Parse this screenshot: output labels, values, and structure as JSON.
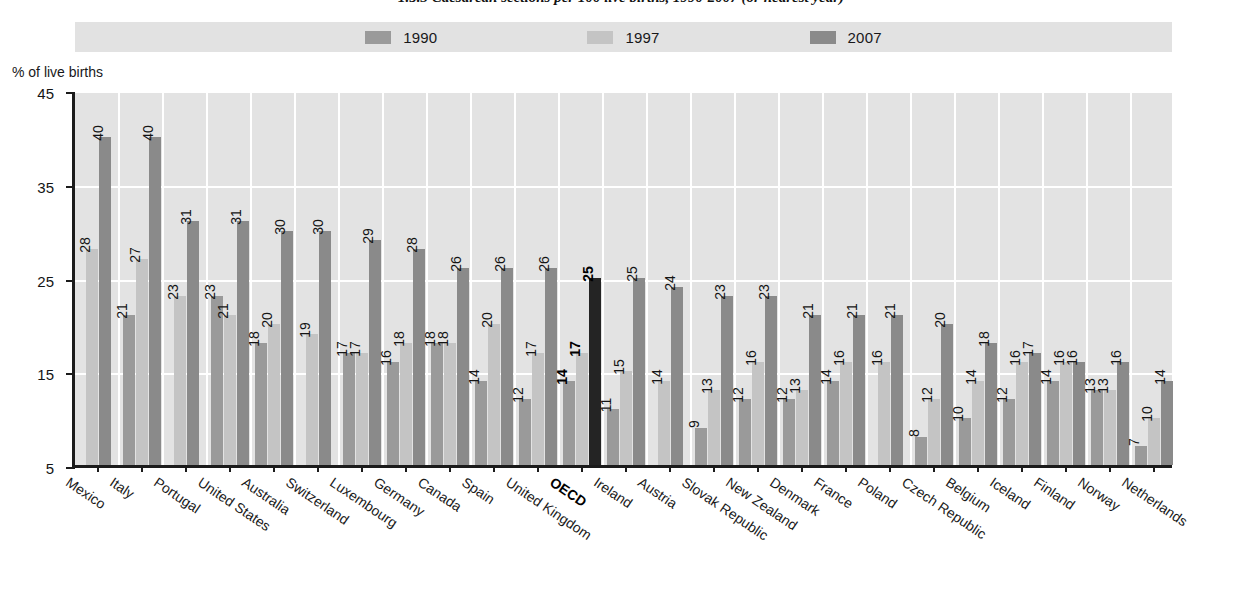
{
  "title": "1.5.3  Caesarean sections per 100 live births, 1990-2007 (or nearest year)",
  "axis_title": "% of live births",
  "legend": {
    "items": [
      {
        "label": "1990",
        "color": "#9a9a9a"
      },
      {
        "label": "1997",
        "color": "#c4c4c4"
      },
      {
        "label": "2007",
        "color": "#8a8a8a"
      }
    ]
  },
  "colors": {
    "plot_background": "#e3e3e3",
    "legend_background": "#e2e2e2",
    "gridline": "#ffffff",
    "axis": "#1b1b1b",
    "series_1990": "#9a9a9a",
    "series_1997": "#c4c4c4",
    "series_2007": "#8a8a8a",
    "highlight_2007": "#242424"
  },
  "chart_data": {
    "type": "bar",
    "title": "1.5.3  Caesarean sections per 100 live births, 1990-2007 (or nearest year)",
    "xlabel": "",
    "ylabel": "% of live births",
    "ylim": [
      5,
      45
    ],
    "yticks": [
      5,
      15,
      25,
      35,
      45
    ],
    "grid": true,
    "legend_position": "top-center",
    "categories": [
      "Mexico",
      "Italy",
      "Portugal",
      "United States",
      "Australia",
      "Switzerland",
      "Luxembourg",
      "Germany",
      "Canada",
      "Spain",
      "United Kingdom",
      "OECD",
      "Ireland",
      "Austria",
      "Slovak Republic",
      "New Zealand",
      "Denmark",
      "France",
      "Poland",
      "Czech Republic",
      "Belgium",
      "Iceland",
      "Finland",
      "Norway",
      "Netherlands"
    ],
    "highlight_category": "OECD",
    "series": [
      {
        "name": "1990",
        "values": [
          null,
          21,
          null,
          23,
          18,
          null,
          17,
          16,
          18,
          14,
          12,
          14,
          11,
          null,
          9,
          12,
          12,
          14,
          null,
          8,
          10,
          12,
          14,
          13,
          7
        ]
      },
      {
        "name": "1997",
        "values": [
          28,
          27,
          23,
          21,
          20,
          19,
          17,
          18,
          18,
          20,
          17,
          17,
          15,
          14,
          13,
          16,
          13,
          16,
          16,
          12,
          14,
          16,
          16,
          13,
          10
        ]
      },
      {
        "name": "2007",
        "values": [
          40,
          40,
          31,
          31,
          30,
          30,
          29,
          28,
          26,
          26,
          26,
          25,
          25,
          24,
          23,
          23,
          21,
          21,
          21,
          20,
          18,
          17,
          16,
          16,
          14
        ]
      }
    ]
  }
}
